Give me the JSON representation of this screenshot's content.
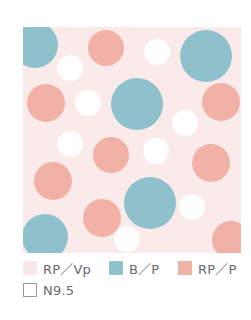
{
  "colors": {
    "page_background": "#ffffff",
    "pattern_background": "#fbeaea",
    "rp_vp": "#f7e9e8",
    "b_p": "#8fc1cd",
    "rp_p": "#f2b1a7",
    "n9_5": "#ffffff"
  },
  "pattern": {
    "description": "polka dot pattern",
    "dots": [
      {
        "color": "b_p",
        "cx": 12,
        "cy": 18,
        "r": 23
      },
      {
        "color": "rp_p",
        "cx": 83,
        "cy": 21,
        "r": 18
      },
      {
        "color": "n9_5",
        "cx": 47,
        "cy": 41,
        "r": 13
      },
      {
        "color": "n9_5",
        "cx": 134,
        "cy": 25,
        "r": 13
      },
      {
        "color": "b_p",
        "cx": 183,
        "cy": 29,
        "r": 26
      },
      {
        "color": "rp_p",
        "cx": 23,
        "cy": 76,
        "r": 19
      },
      {
        "color": "n9_5",
        "cx": 65,
        "cy": 76,
        "r": 13
      },
      {
        "color": "b_p",
        "cx": 114,
        "cy": 77,
        "r": 26
      },
      {
        "color": "rp_p",
        "cx": 198,
        "cy": 75,
        "r": 19
      },
      {
        "color": "n9_5",
        "cx": 162,
        "cy": 96,
        "r": 13
      },
      {
        "color": "n9_5",
        "cx": 47,
        "cy": 117,
        "r": 13
      },
      {
        "color": "rp_p",
        "cx": 88,
        "cy": 128,
        "r": 18
      },
      {
        "color": "n9_5",
        "cx": 133,
        "cy": 124,
        "r": 13
      },
      {
        "color": "rp_p",
        "cx": 188,
        "cy": 136,
        "r": 19
      },
      {
        "color": "rp_p",
        "cx": 30,
        "cy": 154,
        "r": 19
      },
      {
        "color": "b_p",
        "cx": 127,
        "cy": 176,
        "r": 26
      },
      {
        "color": "n9_5",
        "cx": 169,
        "cy": 180,
        "r": 13
      },
      {
        "color": "rp_p",
        "cx": 79,
        "cy": 191,
        "r": 19
      },
      {
        "color": "b_p",
        "cx": 22,
        "cy": 210,
        "r": 23
      },
      {
        "color": "n9_5",
        "cx": 104,
        "cy": 212,
        "r": 13
      },
      {
        "color": "rp_p",
        "cx": 208,
        "cy": 213,
        "r": 19
      }
    ]
  },
  "legend": {
    "items": [
      {
        "label": "RP／Vp",
        "color": "#f7e9e8",
        "outlined": false
      },
      {
        "label": "B／P",
        "color": "#8fc1cd",
        "outlined": false
      },
      {
        "label": "RP／P",
        "color": "#f2b1a7",
        "outlined": false
      },
      {
        "label": "N9.5",
        "color": "#ffffff",
        "outlined": true
      }
    ]
  }
}
